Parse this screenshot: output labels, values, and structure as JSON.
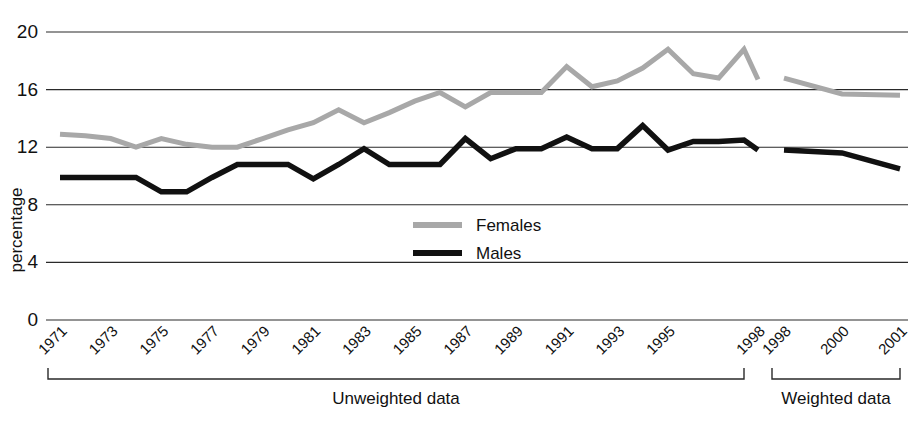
{
  "chart_data": {
    "type": "line",
    "title": "",
    "subtitle": "",
    "xlabel": "",
    "ylabel": "percentage",
    "ylim": [
      0,
      20
    ],
    "yticks": [
      0,
      4,
      8,
      12,
      16,
      20
    ],
    "ytick_labels": [
      "0",
      "4",
      "8",
      "12",
      "16",
      "20"
    ],
    "grid": true,
    "legend_position": "center",
    "panels": [
      {
        "name": "Unweighted data",
        "label": "Unweighted data",
        "x": [
          1971,
          1972,
          1973,
          1974,
          1975,
          1976,
          1977,
          1978,
          1979,
          1980,
          1981,
          1982,
          1983,
          1984,
          1985,
          1986,
          1987,
          1988,
          1989,
          1990,
          1991,
          1992,
          1993,
          1994,
          1995,
          1996,
          1997,
          1998
        ],
        "xtick_labels": [
          "1971",
          "1973",
          "1975",
          "1977",
          "1979",
          "1981",
          "1983",
          "1985",
          "1987",
          "1989",
          "1991",
          "1993",
          "1995",
          "1998"
        ],
        "series": [
          {
            "name": "Females",
            "color": "#a8a8a8",
            "values": [
              12.9,
              12.8,
              12.6,
              12.0,
              12.6,
              12.2,
              12.0,
              12.0,
              12.6,
              13.2,
              13.7,
              14.6,
              13.7,
              14.4,
              15.2,
              15.8,
              14.8,
              15.8,
              15.8,
              15.8,
              17.6,
              16.2,
              16.6,
              17.5,
              18.8,
              17.1,
              16.8,
              18.8
            ],
            "end_value": 16.7
          },
          {
            "name": "Males",
            "color": "#111111",
            "values": [
              9.9,
              9.9,
              9.9,
              9.9,
              8.9,
              8.9,
              9.9,
              10.8,
              10.8,
              10.8,
              9.8,
              10.8,
              11.9,
              10.8,
              10.8,
              10.8,
              12.6,
              11.2,
              11.9,
              11.9,
              12.7,
              11.9,
              11.9,
              13.5,
              11.8,
              12.4,
              12.4,
              12.5
            ],
            "end_value": 11.8
          }
        ]
      },
      {
        "name": "Weighted data",
        "label": "Weighted data",
        "x": [
          1998,
          2000,
          2001
        ],
        "xtick_labels": [
          "1998",
          "2000",
          "2001"
        ],
        "series": [
          {
            "name": "Females",
            "color": "#a8a8a8",
            "values": [
              16.8,
              15.7,
              15.6
            ]
          },
          {
            "name": "Males",
            "color": "#111111",
            "values": [
              11.8,
              11.6,
              10.5
            ]
          }
        ]
      }
    ],
    "legend": [
      {
        "name": "Females",
        "color": "#a8a8a8"
      },
      {
        "name": "Males",
        "color": "#111111"
      }
    ]
  },
  "legend": {
    "females_label": "Females",
    "males_label": "Males"
  },
  "axis": {
    "y_title": "percentage"
  },
  "groups": {
    "unweighted_label": "Unweighted data",
    "weighted_label": "Weighted data"
  },
  "colors": {
    "females": "#a8a8a8",
    "males": "#111111",
    "axis": "#2a2a2a",
    "background": "#ffffff"
  }
}
